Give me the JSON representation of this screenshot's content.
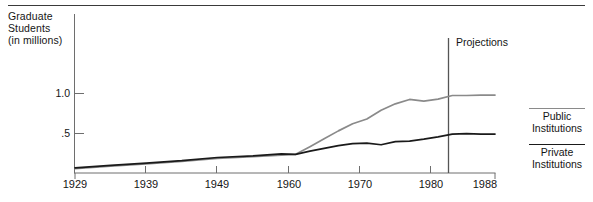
{
  "chart_data": {
    "type": "line",
    "title": "",
    "ylabel": "Graduate Students (in millions)",
    "xlabel": "",
    "ylim": [
      0,
      1.25
    ],
    "xlim": [
      1929,
      1988
    ],
    "grid": false,
    "legend_position": "right",
    "y_ticks": [
      {
        "value": 1.0,
        "label": "1.0"
      },
      {
        "value": 0.5,
        "label": ".5"
      }
    ],
    "x_ticks": [
      {
        "value": 1929,
        "label": "1929"
      },
      {
        "value": 1939,
        "label": "1939"
      },
      {
        "value": 1949,
        "label": "1949"
      },
      {
        "value": 1960,
        "label": "1960"
      },
      {
        "value": 1970,
        "label": "1970"
      },
      {
        "value": 1980,
        "label": "1980"
      },
      {
        "value": 1988,
        "label": "1988"
      }
    ],
    "annotations": [
      {
        "name": "projection-divider",
        "label": "Projections",
        "x": 1982
      }
    ],
    "series": [
      {
        "name": "Public Institutions",
        "color": "#8a8a8a",
        "x": [
          1929,
          1934,
          1939,
          1944,
          1949,
          1954,
          1958,
          1960,
          1962,
          1964,
          1966,
          1968,
          1970,
          1972,
          1974,
          1976,
          1978,
          1980,
          1982,
          1984,
          1986,
          1988
        ],
        "values": [
          0.055,
          0.085,
          0.115,
          0.145,
          0.185,
          0.205,
          0.225,
          0.235,
          0.33,
          0.43,
          0.53,
          0.62,
          0.68,
          0.79,
          0.87,
          0.925,
          0.905,
          0.93,
          0.975,
          0.975,
          0.98,
          0.98
        ]
      },
      {
        "name": "Private Institutions",
        "color": "#1a1a1a",
        "x": [
          1929,
          1934,
          1939,
          1944,
          1949,
          1954,
          1958,
          1960,
          1962,
          1964,
          1966,
          1968,
          1970,
          1972,
          1974,
          1976,
          1978,
          1980,
          1982,
          1984,
          1986,
          1988
        ],
        "values": [
          0.065,
          0.095,
          0.125,
          0.155,
          0.195,
          0.215,
          0.24,
          0.235,
          0.275,
          0.31,
          0.345,
          0.37,
          0.375,
          0.355,
          0.395,
          0.4,
          0.425,
          0.455,
          0.49,
          0.495,
          0.49,
          0.49
        ]
      }
    ]
  },
  "axis_title": {
    "text": "Graduate\nStudents\n(in millions)"
  },
  "legend": [
    {
      "label": "Public\nInstitutions",
      "color": "#8a8a8a"
    },
    {
      "label": "Private\nInstitutions",
      "color": "#1a1a1a"
    }
  ],
  "projection": {
    "label": "Projections"
  }
}
